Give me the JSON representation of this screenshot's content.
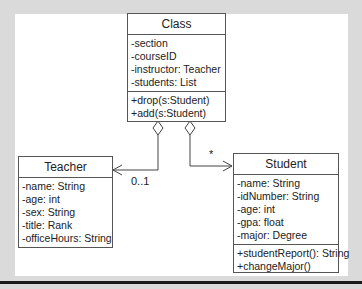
{
  "diagram": {
    "type": "UML class diagram",
    "classes": [
      {
        "name": "Class",
        "attributes": [
          "-section",
          "-courseID",
          "-instructor: Teacher",
          "-students: List"
        ],
        "methods": [
          "+drop(s:Student)",
          "+add(s:Student)"
        ]
      },
      {
        "name": "Teacher",
        "attributes": [
          "-name: String",
          "-age: int",
          "-sex: String",
          "-title: Rank",
          "-officeHours: String"
        ],
        "methods": []
      },
      {
        "name": "Student",
        "attributes": [
          "-name: String",
          "-idNumber: String",
          "-age: int",
          "-gpa: float",
          "-major: Degree"
        ],
        "methods": [
          "+studentReport(): String",
          "+changeMajor()"
        ]
      }
    ],
    "associations": [
      {
        "from": "Class",
        "to": "Teacher",
        "kind": "aggregation",
        "multiplicity": "0..1"
      },
      {
        "from": "Class",
        "to": "Student",
        "kind": "aggregation",
        "multiplicity": "*"
      }
    ]
  }
}
